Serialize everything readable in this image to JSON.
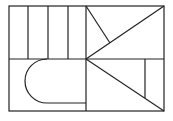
{
  "diagram": {
    "stroke_color": "#222222",
    "background": "#ffffff",
    "outer_frame": {
      "x": 9,
      "y": 6,
      "width": 155,
      "height": 105
    },
    "lines": [
      {
        "name": "mid-horizontal",
        "x1": 9,
        "y1": 59,
        "x2": 164,
        "y2": 59
      },
      {
        "name": "mid-vertical",
        "x1": 86,
        "y1": 6,
        "x2": 86,
        "y2": 111
      },
      {
        "name": "stripe-1",
        "x1": 28,
        "y1": 6,
        "x2": 28,
        "y2": 59
      },
      {
        "name": "stripe-2",
        "x1": 48,
        "y1": 6,
        "x2": 48,
        "y2": 59
      },
      {
        "name": "stripe-3",
        "x1": 68,
        "y1": 6,
        "x2": 68,
        "y2": 59
      },
      {
        "name": "upper-diagonal",
        "x1": 164,
        "y1": 6,
        "x2": 86,
        "y2": 59
      },
      {
        "name": "upper-short-diagonal",
        "x1": 86,
        "y1": 6,
        "x2": 110,
        "y2": 43
      },
      {
        "name": "lower-diagonal",
        "x1": 86,
        "y1": 59,
        "x2": 164,
        "y2": 111
      },
      {
        "name": "lower-vertical",
        "x1": 145,
        "y1": 59,
        "x2": 145,
        "y2": 98
      }
    ],
    "d_shape": {
      "path": "M86,103 L47,103 A22,22 0 0 1 47,59"
    }
  }
}
